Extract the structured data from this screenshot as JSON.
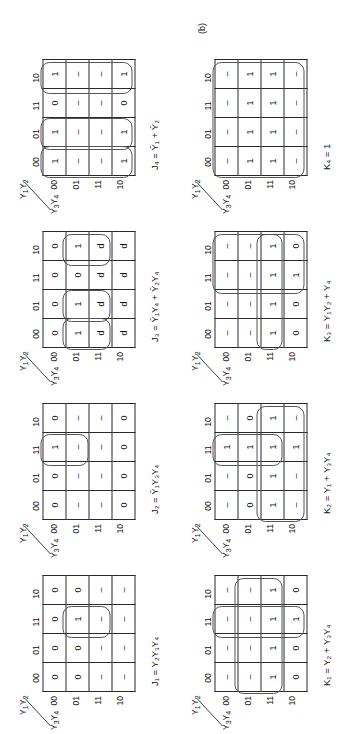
{
  "figure": {
    "caption": "(b)",
    "axis_top_label": "Y1Y2",
    "axis_bottom_label": "Y3Y4",
    "col_headers": [
      "00",
      "01",
      "11",
      "10"
    ],
    "row_headers": [
      "00",
      "01",
      "11",
      "10"
    ]
  },
  "maps": [
    {
      "id": "j1",
      "name": "J1-kmap",
      "equation": "J₁ = Y₂Y₃Y₄",
      "eq_lhs": "J",
      "eq_sub": "1",
      "rows": [
        [
          "0",
          "0",
          "0",
          "0"
        ],
        [
          "0",
          "0",
          "1",
          "0"
        ],
        [
          "–",
          "–",
          "–",
          "–"
        ],
        [
          "–",
          "–",
          "–",
          "–"
        ]
      ],
      "loops": [
        {
          "row": 1,
          "col": 2,
          "w": 1,
          "h": 2
        }
      ]
    },
    {
      "id": "k1",
      "name": "K1-kmap",
      "equation": "K₁ = Y₂ + Y₃Y₄",
      "eq_lhs": "K",
      "eq_sub": "1",
      "rows": [
        [
          "–",
          "–",
          "–",
          "–"
        ],
        [
          "–",
          "–",
          "–",
          "–"
        ],
        [
          "1",
          "1",
          "1",
          "1"
        ],
        [
          "0",
          "0",
          "1",
          "0"
        ]
      ],
      "loops": [
        {
          "row": 1,
          "col": 0,
          "w": 4,
          "h": 2
        },
        {
          "row": 0,
          "col": 2,
          "w": 1,
          "h": 4
        }
      ]
    },
    {
      "id": "j2",
      "name": "J2-kmap",
      "equation": "J₂ = Ȳ₁Y₃Y₄",
      "eq_lhs": "J",
      "eq_sub": "2",
      "rows": [
        [
          "0",
          "0",
          "1",
          "0"
        ],
        [
          "–",
          "–",
          "–",
          "–"
        ],
        [
          "–",
          "–",
          "–",
          "–"
        ],
        [
          "0",
          "0",
          "0",
          "0"
        ]
      ],
      "loops": [
        {
          "row": 0,
          "col": 2,
          "w": 1,
          "h": 2
        }
      ]
    },
    {
      "id": "k2",
      "name": "K2-kmap",
      "equation": "K₂ = Y₁ + Y₃Y₄",
      "eq_lhs": "K",
      "eq_sub": "2",
      "rows": [
        [
          "–",
          "–",
          "1",
          "–"
        ],
        [
          "0",
          "0",
          "1",
          "0"
        ],
        [
          "1",
          "1",
          "1",
          "1"
        ],
        [
          "–",
          "–",
          "1",
          "–"
        ]
      ],
      "loops": [
        {
          "row": 2,
          "col": 0,
          "w": 4,
          "h": 2
        },
        {
          "row": 0,
          "col": 2,
          "w": 1,
          "h": 3
        }
      ]
    },
    {
      "id": "j3",
      "name": "J3-kmap",
      "equation": "J₃ = Ȳ₁Y₄ + Ȳ₂Y₄",
      "eq_lhs": "J",
      "eq_sub": "3",
      "rows": [
        [
          "0",
          "0",
          "0",
          "0"
        ],
        [
          "1",
          "1",
          "0",
          "1"
        ],
        [
          "d",
          "d",
          "d",
          "d"
        ],
        [
          "d",
          "d",
          "d",
          "d"
        ]
      ],
      "loops": [
        {
          "row": 1,
          "col": 0,
          "w": 1,
          "h": 2
        },
        {
          "row": 1,
          "col": 1,
          "w": 1,
          "h": 2
        },
        {
          "row": 1,
          "col": 3,
          "w": 1,
          "h": 2
        }
      ]
    },
    {
      "id": "k3",
      "name": "K3-kmap",
      "equation": "K₃ = Y₁Y₂ + Y₄",
      "eq_lhs": "K",
      "eq_sub": "3",
      "rows": [
        [
          "–",
          "–",
          "–",
          "–"
        ],
        [
          "–",
          "–",
          "–",
          "–"
        ],
        [
          "1",
          "1",
          "1",
          "1"
        ],
        [
          "0",
          "0",
          "1",
          "0"
        ]
      ],
      "loops": [
        {
          "row": 0,
          "col": 2,
          "w": 2,
          "h": 4
        },
        {
          "row": 2,
          "col": 0,
          "w": 4,
          "h": 1
        }
      ]
    },
    {
      "id": "j4",
      "name": "J4-kmap",
      "equation": "J₄ = Ȳ₁ + Ȳ₂",
      "eq_lhs": "J",
      "eq_sub": "4",
      "rows": [
        [
          "1",
          "1",
          "0",
          "1"
        ],
        [
          "–",
          "–",
          "–",
          "–"
        ],
        [
          "–",
          "–",
          "–",
          "–"
        ],
        [
          "1",
          "1",
          "0",
          "1"
        ]
      ],
      "loops": [
        {
          "row": 0,
          "col": 0,
          "w": 1,
          "h": 4
        },
        {
          "row": 0,
          "col": 1,
          "w": 1,
          "h": 4
        },
        {
          "row": 0,
          "col": 3,
          "w": 1,
          "h": 4
        }
      ]
    },
    {
      "id": "k4",
      "name": "K4-kmap",
      "equation": "K₄ = 1",
      "eq_lhs": "K",
      "eq_sub": "4",
      "rows": [
        [
          "–",
          "–",
          "–",
          "–"
        ],
        [
          "1",
          "1",
          "1",
          "1"
        ],
        [
          "1",
          "1",
          "1",
          "1"
        ],
        [
          "–",
          "–",
          "–",
          "–"
        ]
      ],
      "loops": [
        {
          "row": 0,
          "col": 0,
          "w": 4,
          "h": 4
        }
      ]
    }
  ]
}
